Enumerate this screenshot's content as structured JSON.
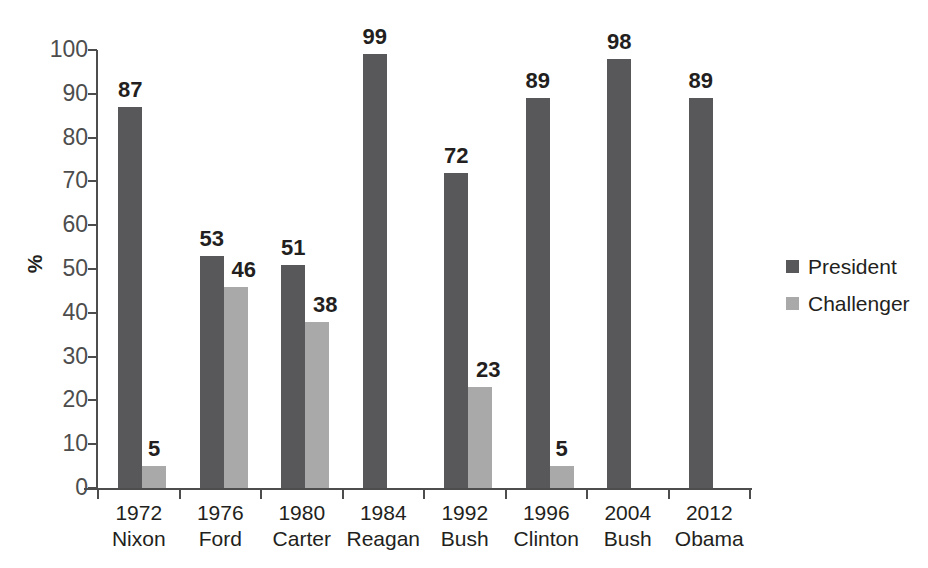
{
  "chart_data": {
    "type": "bar",
    "title": "",
    "subtitle": "",
    "xlabel": "",
    "ylabel": "%",
    "ylim": [
      0,
      100
    ],
    "ytick_step": 10,
    "yticks": [
      "100",
      "90",
      "80",
      "70",
      "60",
      "50",
      "40",
      "30",
      "20",
      "10",
      "0"
    ],
    "grid": false,
    "legend_position": "right",
    "categories": [
      "1972\nNixon",
      "1976\nFord",
      "1980\nCarter",
      "1984\nReagan",
      "1992\nBush",
      "1996\nClinton",
      "2004\nBush",
      "2012\nObama"
    ],
    "category_years": [
      "1972",
      "1976",
      "1980",
      "1984",
      "1992",
      "1996",
      "2004",
      "2012"
    ],
    "category_names": [
      "Nixon",
      "Ford",
      "Carter",
      "Reagan",
      "Bush",
      "Clinton",
      "Bush",
      "Obama"
    ],
    "series": [
      {
        "name": "President",
        "color": "#58585a",
        "values": [
          87,
          53,
          51,
          99,
          72,
          89,
          98,
          89
        ]
      },
      {
        "name": "Challenger",
        "color": "#a9a9a9",
        "values": [
          5,
          46,
          38,
          null,
          23,
          5,
          null,
          null
        ]
      }
    ]
  },
  "axis": {
    "y_label": "%",
    "ticks": [
      {
        "label": "100",
        "value": 100
      },
      {
        "label": "90",
        "value": 90
      },
      {
        "label": "80",
        "value": 80
      },
      {
        "label": "70",
        "value": 70
      },
      {
        "label": "60",
        "value": 60
      },
      {
        "label": "50",
        "value": 50
      },
      {
        "label": "40",
        "value": 40
      },
      {
        "label": "30",
        "value": 30
      },
      {
        "label": "20",
        "value": 20
      },
      {
        "label": "10",
        "value": 10
      },
      {
        "label": "0",
        "value": 0
      }
    ]
  },
  "legend": {
    "items": [
      {
        "label": "President",
        "color": "#58585a"
      },
      {
        "label": "Challenger",
        "color": "#a9a9a9"
      }
    ]
  },
  "groups": [
    {
      "year": "1972",
      "name": "Nixon",
      "president_value": "87",
      "challenger_value": "5",
      "president_num": 87,
      "challenger_num": 5,
      "challenger_label_pos": "top"
    },
    {
      "year": "1976",
      "name": "Ford",
      "president_value": "53",
      "challenger_value": "46",
      "president_num": 53,
      "challenger_num": 46,
      "challenger_label_pos": "right"
    },
    {
      "year": "1980",
      "name": "Carter",
      "president_value": "51",
      "challenger_value": "38",
      "president_num": 51,
      "challenger_num": 38,
      "challenger_label_pos": "right"
    },
    {
      "year": "1984",
      "name": "Reagan",
      "president_value": "99",
      "challenger_value": "",
      "president_num": 99,
      "challenger_num": null,
      "challenger_label_pos": "none"
    },
    {
      "year": "1992",
      "name": "Bush",
      "president_value": "72",
      "challenger_value": "23",
      "president_num": 72,
      "challenger_num": 23,
      "challenger_label_pos": "right"
    },
    {
      "year": "1996",
      "name": "Clinton",
      "president_value": "89",
      "challenger_value": "5",
      "president_num": 89,
      "challenger_num": 5,
      "challenger_label_pos": "top"
    },
    {
      "year": "2004",
      "name": "Bush",
      "president_value": "98",
      "challenger_value": "",
      "president_num": 98,
      "challenger_num": null,
      "challenger_label_pos": "none"
    },
    {
      "year": "2012",
      "name": "Obama",
      "president_value": "89",
      "challenger_value": "",
      "president_num": 89,
      "challenger_num": null,
      "challenger_label_pos": "none"
    }
  ]
}
